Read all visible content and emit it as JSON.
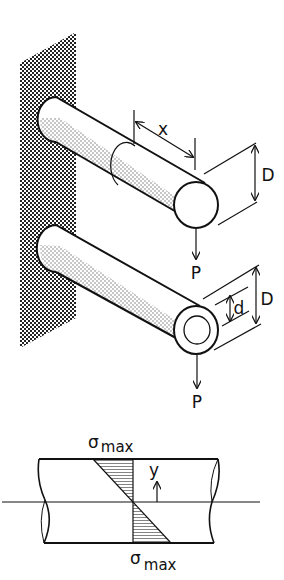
{
  "figure": {
    "type": "engineering-diagram",
    "colors": {
      "ink": "#111111",
      "background": "#ffffff",
      "wall_pattern": "#222222"
    }
  },
  "top_beam": {
    "section": "solid circular",
    "labels": {
      "length": "x",
      "diameter": "D",
      "load": "P"
    }
  },
  "bottom_beam": {
    "section": "hollow circular",
    "labels": {
      "inner_diameter": "d",
      "outer_diameter": "D",
      "load": "P"
    }
  },
  "stress_diagram": {
    "labels": {
      "top_stress_symbol": "σ",
      "top_stress_sub": "max",
      "bottom_stress_symbol": "σ",
      "bottom_stress_sub": "max",
      "axis": "y"
    }
  }
}
